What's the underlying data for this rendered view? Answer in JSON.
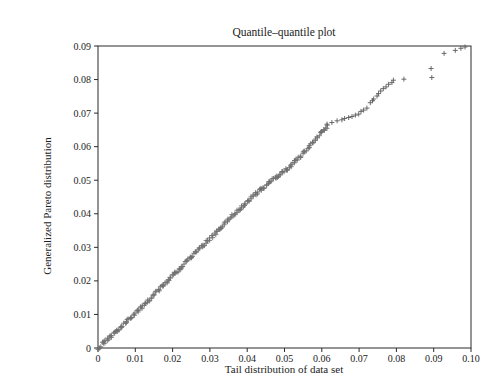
{
  "page": {
    "background": "#ffffff"
  },
  "chart_data": {
    "type": "scatter",
    "title": "Quantile–quantile plot",
    "xlabel": "Tail distribution of data set",
    "ylabel": "Generalized Pareto distribution",
    "xlim": [
      0,
      0.1
    ],
    "ylim": [
      0,
      0.09
    ],
    "x_tick_labels": [
      "0",
      "0.01",
      "0.02",
      "0.03",
      "0.04",
      "0.05",
      "0.06",
      "0.07",
      "0.08",
      "0.09",
      "0.10"
    ],
    "y_tick_labels": [
      "0",
      "0.01",
      "0.02",
      "0.03",
      "0.04",
      "0.05",
      "0.06",
      "0.07",
      "0.08",
      "0.09"
    ],
    "grid": false,
    "legend": "none",
    "marker": "+",
    "colors": {
      "marker_dense": "#707070",
      "marker_sparse": "#5c5c5c",
      "axis": "#2b2b2b",
      "text": "#1c1c1c",
      "background": "#ffffff"
    },
    "series": [
      {
        "name": "lower-quantiles-dense-band",
        "representation": "interpolated-band",
        "n_points": 240,
        "x_range": [
          0,
          0.0615
        ],
        "jitter_x": 0.0005,
        "jitter_y": 0.001,
        "anchors": [
          [
            0,
            0
          ],
          [
            0.004,
            0.004
          ],
          [
            0.008,
            0.0082
          ],
          [
            0.012,
            0.0124
          ],
          [
            0.016,
            0.017
          ],
          [
            0.02,
            0.0215
          ],
          [
            0.024,
            0.026
          ],
          [
            0.028,
            0.0305
          ],
          [
            0.031,
            0.0335
          ],
          [
            0.034,
            0.0372
          ],
          [
            0.037,
            0.0405
          ],
          [
            0.04,
            0.0435
          ],
          [
            0.043,
            0.0466
          ],
          [
            0.046,
            0.0494
          ],
          [
            0.049,
            0.0518
          ],
          [
            0.051,
            0.0537
          ],
          [
            0.053,
            0.0557
          ],
          [
            0.055,
            0.058
          ],
          [
            0.057,
            0.0605
          ],
          [
            0.059,
            0.0633
          ],
          [
            0.0605,
            0.0649
          ],
          [
            0.0615,
            0.066
          ]
        ]
      },
      {
        "name": "upper-tail-quantiles",
        "representation": "explicit",
        "points": [
          [
            0.0614,
            0.0667
          ],
          [
            0.0627,
            0.0672
          ],
          [
            0.0641,
            0.0677
          ],
          [
            0.0654,
            0.068
          ],
          [
            0.0661,
            0.0684
          ],
          [
            0.0672,
            0.0687
          ],
          [
            0.0681,
            0.069
          ],
          [
            0.069,
            0.0694
          ],
          [
            0.0699,
            0.0697
          ],
          [
            0.0705,
            0.0705
          ],
          [
            0.0712,
            0.0709
          ],
          [
            0.0721,
            0.0715
          ],
          [
            0.073,
            0.0731
          ],
          [
            0.0736,
            0.0737
          ],
          [
            0.0739,
            0.0742
          ],
          [
            0.0748,
            0.0751
          ],
          [
            0.0752,
            0.0758
          ],
          [
            0.0758,
            0.0766
          ],
          [
            0.0765,
            0.0773
          ],
          [
            0.0772,
            0.0778
          ],
          [
            0.0779,
            0.0786
          ],
          [
            0.0788,
            0.0791
          ],
          [
            0.0792,
            0.0798
          ],
          [
            0.082,
            0.0801
          ],
          [
            0.0893,
            0.0833
          ],
          [
            0.0895,
            0.0806
          ],
          [
            0.0928,
            0.0878
          ],
          [
            0.0958,
            0.0887
          ],
          [
            0.0973,
            0.0893
          ],
          [
            0.0984,
            0.0897
          ]
        ]
      }
    ]
  }
}
